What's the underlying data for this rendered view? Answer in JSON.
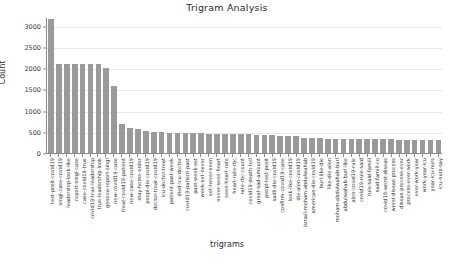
{
  "chart_data": {
    "type": "bar",
    "title": "Trigram Analysis",
    "xlabel": "trigrams",
    "ylabel": "Count",
    "ylim": [
      0,
      3200
    ],
    "yticks": [
      0,
      500,
      1000,
      1500,
      2000,
      2500,
      3000
    ],
    "ytick_labels": [
      "0",
      "500",
      "1000",
      "1500",
      "2000",
      "2500",
      "3000"
    ],
    "grid": true,
    "legend": "none",
    "bar_color": "#9a9a9a",
    "categories": [
      "test-posit-covid19",
      "singl-case-covid19",
      "leadership-look-like",
      "report-singl-case",
      "case-covid19-true",
      "covid19-true-leadership",
      "true-leadership-look",
      "genova-report-singl",
      "new-covid19-case",
      "treat-covid19-patient",
      "new-case-covid19",
      "stay-home-order",
      "peopl-die-covid19",
      "doctor-treat-covid19",
      "icu-doctor-treat",
      "patient-past-week",
      "died-icu-doctor",
      "covid19-patient-past",
      "past-week-set",
      "week-set-never",
      "set-never-seen",
      "never-seen-heart",
      "seen-heart-rate",
      "heart-rate-rbc",
      "rate-rbc-count",
      "covid19-death-toll",
      "great-sad-amount",
      "peopl-test-posit",
      "sadli-die-covid19",
      "confirm-covid19-case",
      "look-like-covid19",
      "die-alon-covid19",
      "ismail-moham-abdulwahab",
      "american-die-covid19",
      "burl-like-die",
      "like-die-alon",
      "moham-abdulwahab-burl",
      "abdulwahab-burl-like",
      "alon-covid19-rule",
      "covid19-rule-said",
      "rule-said-famili",
      "said-famili-co",
      "covid19-worst-diseas",
      "worst-diseas-process",
      "diseas-process-ever",
      "process-ever-work",
      "ever-work-year",
      "work-year-icu",
      "year-icu-nurs",
      "icu-nurs-say"
    ],
    "values": [
      3150,
      2090,
      2090,
      2090,
      2090,
      2090,
      2090,
      1990,
      1580,
      680,
      600,
      560,
      520,
      500,
      490,
      480,
      475,
      470,
      465,
      460,
      455,
      455,
      455,
      455,
      455,
      450,
      420,
      415,
      415,
      410,
      405,
      400,
      350,
      345,
      345,
      340,
      340,
      335,
      335,
      330,
      330,
      325,
      320,
      320,
      315,
      315,
      310,
      310,
      305,
      305
    ]
  }
}
